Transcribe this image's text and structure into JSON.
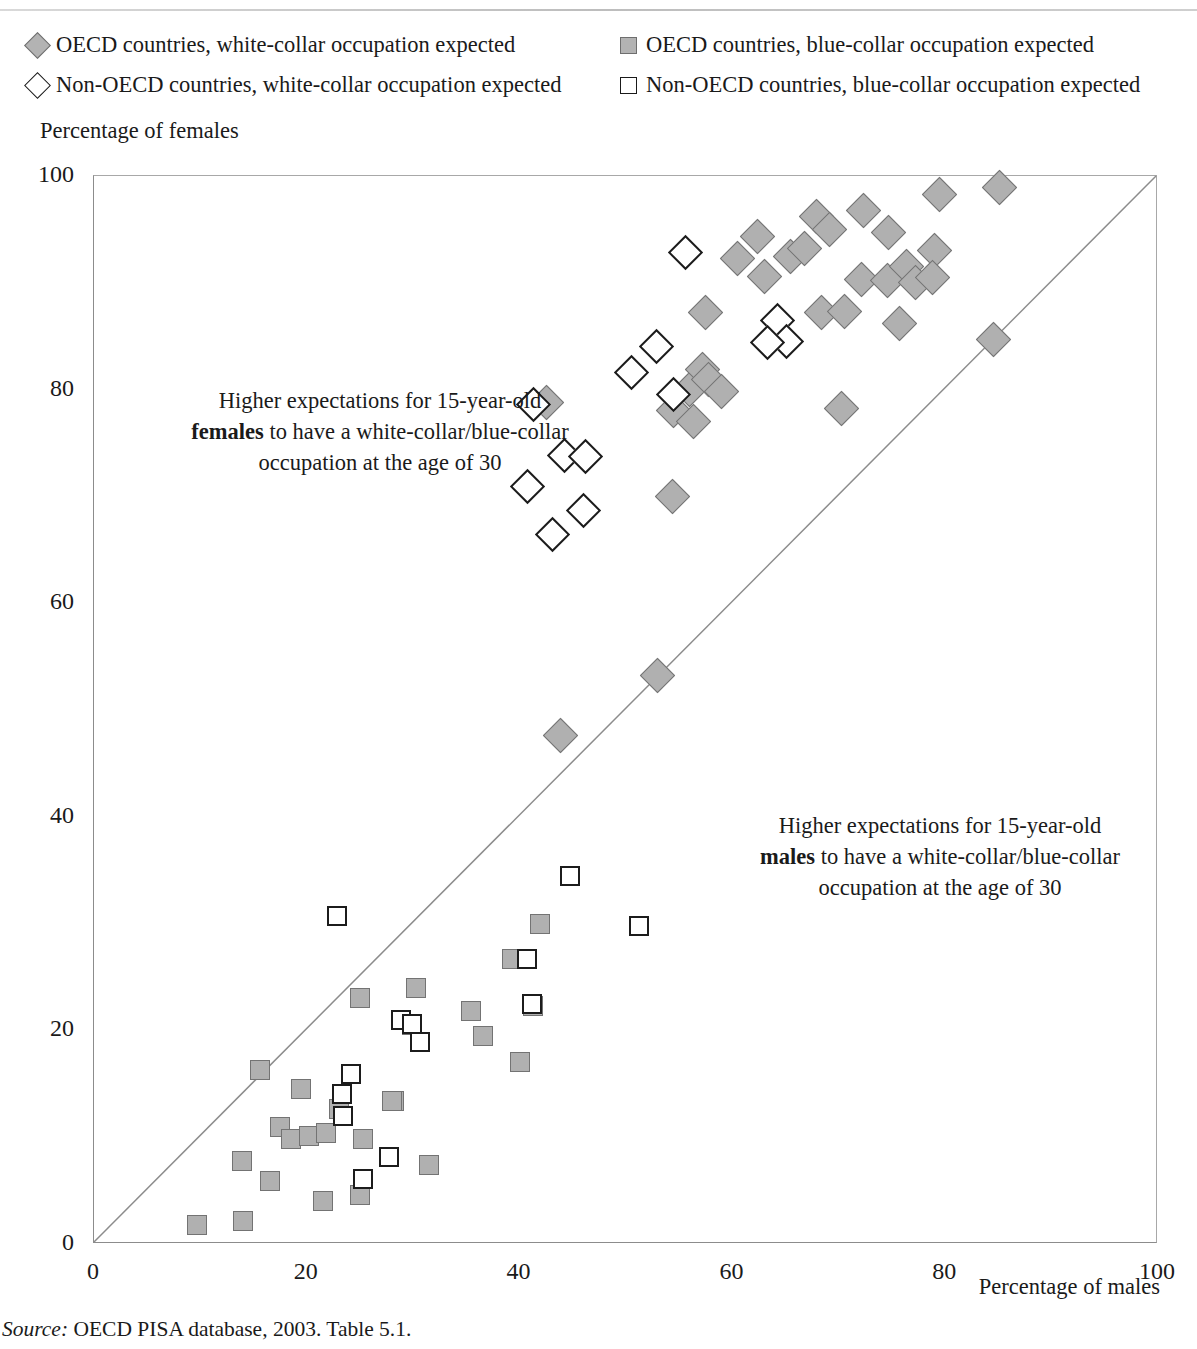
{
  "legend": {
    "items": [
      {
        "marker": "diamond-filled-icon",
        "label": "OECD countries, white-collar occupation expected"
      },
      {
        "marker": "square-filled-icon",
        "label": "OECD countries, blue-collar occupation expected"
      },
      {
        "marker": "diamond-open-icon",
        "label": "Non-OECD countries, white-collar occupation expected"
      },
      {
        "marker": "square-open-icon",
        "label": "Non-OECD countries, blue-collar occupation expected"
      }
    ]
  },
  "annotations": {
    "females": {
      "line1": "Higher expectations for 15-year-old",
      "bold": "females",
      "line2_rest": " to have a white-collar/blue-collar",
      "line3": "occupation at the age of 30"
    },
    "males": {
      "line1": "Higher expectations for 15-year-old",
      "bold": "males",
      "line2_rest": " to have a white-collar/blue-collar",
      "line3": "occupation at the age of 30"
    }
  },
  "source": {
    "label": "Source:",
    "text": " OECD PISA database, 2003. Table 5.1."
  },
  "colors": {
    "oecd_fill": "#b0b0b0",
    "oecd_stroke": "#737373",
    "non_stroke": "#1c1c1c",
    "axis": "#8c8c8c"
  },
  "chart_data": {
    "type": "scatter",
    "title": "",
    "xlabel": "Percentage of males",
    "ylabel": "Percentage of females",
    "xlim": [
      0,
      100
    ],
    "ylim": [
      0,
      100
    ],
    "xticks": [
      0,
      20,
      40,
      60,
      80,
      100
    ],
    "yticks": [
      0,
      20,
      40,
      60,
      80,
      100
    ],
    "grid": false,
    "legend_position": "top",
    "reference_line": {
      "type": "identity",
      "from": [
        0,
        0
      ],
      "to": [
        100,
        100
      ]
    },
    "series": [
      {
        "name": "OECD countries, white-collar occupation expected",
        "marker": "diamond-filled",
        "points": [
          [
            62.4,
            94.3
          ],
          [
            65.5,
            92.5
          ],
          [
            67.9,
            96.2
          ],
          [
            72.3,
            96.8
          ],
          [
            79.5,
            98.3
          ],
          [
            85.1,
            98.9
          ],
          [
            60.5,
            92.3
          ],
          [
            66.8,
            93.2
          ],
          [
            69.1,
            95.0
          ],
          [
            74.7,
            94.7
          ],
          [
            79.0,
            93.0
          ],
          [
            63.0,
            90.6
          ],
          [
            72.1,
            90.3
          ],
          [
            74.6,
            90.2
          ],
          [
            76.4,
            91.5
          ],
          [
            77.2,
            90.0
          ],
          [
            78.8,
            90.5
          ],
          [
            57.5,
            87.2
          ],
          [
            68.4,
            87.2
          ],
          [
            70.5,
            87.3
          ],
          [
            75.7,
            86.2
          ],
          [
            84.5,
            84.7
          ],
          [
            56.0,
            80.0
          ],
          [
            57.2,
            81.9
          ],
          [
            57.8,
            80.9
          ],
          [
            59.0,
            79.8
          ],
          [
            42.5,
            78.8
          ],
          [
            54.5,
            78.0
          ],
          [
            70.3,
            78.2
          ],
          [
            56.3,
            77.0
          ],
          [
            54.4,
            70.0
          ],
          [
            53.0,
            53.2
          ],
          [
            43.8,
            47.6
          ]
        ]
      },
      {
        "name": "Non-OECD countries, white-collar occupation expected",
        "marker": "diamond-open",
        "points": [
          [
            55.6,
            92.8
          ],
          [
            64.2,
            86.5
          ],
          [
            65.1,
            84.5
          ],
          [
            63.3,
            84.4
          ],
          [
            52.9,
            84.0
          ],
          [
            50.5,
            81.6
          ],
          [
            54.5,
            79.5
          ],
          [
            41.3,
            78.6
          ],
          [
            44.2,
            73.8
          ],
          [
            46.2,
            73.7
          ],
          [
            40.7,
            70.9
          ],
          [
            46.0,
            68.7
          ],
          [
            43.1,
            66.4
          ]
        ]
      },
      {
        "name": "OECD countries, blue-collar occupation expected",
        "marker": "square-filled",
        "points": [
          [
            15.6,
            16.3
          ],
          [
            25.0,
            23.0
          ],
          [
            30.3,
            24.0
          ],
          [
            35.4,
            21.8
          ],
          [
            29.9,
            20.5
          ],
          [
            36.6,
            19.5
          ],
          [
            40.0,
            17.0
          ],
          [
            41.3,
            22.3
          ],
          [
            39.3,
            26.7
          ],
          [
            41.9,
            30.0
          ],
          [
            19.5,
            14.5
          ],
          [
            17.5,
            11.0
          ],
          [
            18.5,
            9.8
          ],
          [
            20.2,
            10.1
          ],
          [
            21.8,
            10.4
          ],
          [
            23.0,
            12.6
          ],
          [
            25.3,
            9.8
          ],
          [
            13.9,
            7.8
          ],
          [
            16.5,
            5.9
          ],
          [
            21.5,
            4.0
          ],
          [
            25.0,
            4.6
          ],
          [
            31.5,
            7.4
          ],
          [
            28.2,
            13.4
          ],
          [
            28.0,
            13.4
          ],
          [
            9.7,
            1.8
          ],
          [
            14.0,
            2.2
          ]
        ]
      },
      {
        "name": "Non-OECD countries, blue-collar occupation expected",
        "marker": "square-open",
        "points": [
          [
            22.8,
            30.7
          ],
          [
            44.7,
            34.5
          ],
          [
            51.2,
            29.8
          ],
          [
            40.7,
            26.7
          ],
          [
            41.2,
            22.5
          ],
          [
            28.9,
            21.0
          ],
          [
            29.9,
            20.6
          ],
          [
            30.6,
            18.9
          ],
          [
            24.2,
            15.9
          ],
          [
            23.3,
            14.0
          ],
          [
            23.4,
            12.0
          ],
          [
            25.3,
            6.1
          ],
          [
            27.7,
            8.1
          ]
        ]
      }
    ]
  }
}
